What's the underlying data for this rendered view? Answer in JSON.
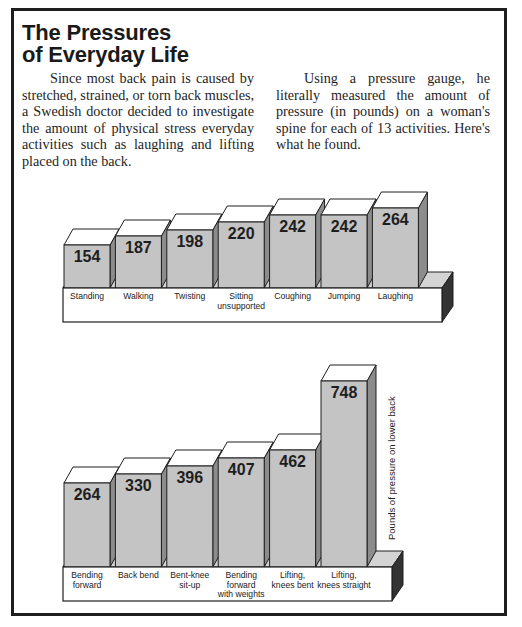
{
  "article": {
    "title_line1": "The Pressures",
    "title_line2": "of Everyday Life",
    "paragraph_left": "Since most back pain is caused by stretched, strained, or torn back muscles, a Swedish doctor decided to investigate the amount of physical stress everyday activities such as laughing and lifting placed on the back.",
    "paragraph_right": "Using a pressure gauge, he literally measured the amount of pressure (in pounds) on a woman's spine for each of 13 activities. Here's what he found."
  },
  "colors": {
    "bar_front": "#c4c4c4",
    "bar_side": "#8c8c8c",
    "bar_top": "#ffffff",
    "base_front": "#ffffff",
    "base_side": "#333333",
    "base_top": "#d4d4d4",
    "outline": "#1e1e1e"
  },
  "chart_data": [
    {
      "type": "bar",
      "title": "",
      "categories": [
        "Standing",
        "Walking",
        "Twisting",
        "Sitting unsupported",
        "Coughing",
        "Jumping",
        "Laughing"
      ],
      "category_lines": [
        [
          "Standing"
        ],
        [
          "Walking"
        ],
        [
          "Twisting"
        ],
        [
          "Sitting",
          "unsupported"
        ],
        [
          "Coughing"
        ],
        [
          "Jumping"
        ],
        [
          "Laughing"
        ]
      ],
      "values": [
        154,
        187,
        198,
        220,
        242,
        242,
        264
      ],
      "xlabel": "",
      "ylabel": "Pounds of pressure on lower back",
      "style": "3d-bars-with-data-labels"
    },
    {
      "type": "bar",
      "title": "",
      "categories": [
        "Bending forward",
        "Back bend",
        "Bent-knee sit-up",
        "Bending forward with weights",
        "Lifting, knees bent",
        "Lifting, knees straight"
      ],
      "category_lines": [
        [
          "Bending",
          "forward"
        ],
        [
          "Back bend"
        ],
        [
          "Bent-knee",
          "sit-up"
        ],
        [
          "Bending",
          "forward",
          "with weights"
        ],
        [
          "Lifting,",
          "knees bent"
        ],
        [
          "Lifting,",
          "knees straight"
        ]
      ],
      "values": [
        264,
        330,
        396,
        407,
        462,
        748
      ],
      "xlabel": "",
      "ylabel": "Pounds of pressure on lower back",
      "style": "3d-bars-with-data-labels"
    }
  ]
}
